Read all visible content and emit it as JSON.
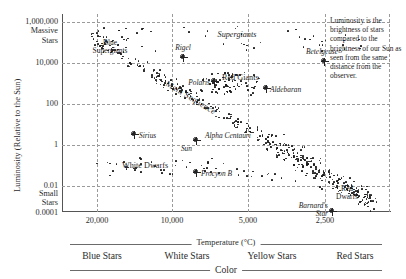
{
  "figure": {
    "caption": "Luminosity is the brightness of stars compared to the brightness of our Sun as seen from the same distance from the observer."
  },
  "chart_data": {
    "type": "scatter",
    "title": "",
    "xlabel": "Temperature (°C)",
    "ylabel": "Luminosity (Relative to the Sun)",
    "secondary_xlabel": "Color",
    "grid": true,
    "legend_position": "none",
    "x_axis": {
      "label": "Temperature (°C)",
      "ticks": [
        "20,000",
        "10,000",
        "5,000",
        "2,500"
      ],
      "tick_values": [
        20000,
        10000,
        5000,
        2500
      ],
      "scale": "log-reversed",
      "range_note": "hot (left) to cool (right)"
    },
    "y_axis": {
      "label": "Luminosity (Relative to the Sun)",
      "ticks": [
        "1,000,000",
        "10,000",
        "100",
        "1",
        "0.01",
        "0.0001"
      ],
      "tick_values": [
        1000000,
        10000,
        100,
        1,
        0.01,
        0.0001
      ],
      "scale": "log",
      "top_annotation": "Massive\nStars",
      "top_annotation_line1": "Massive",
      "top_annotation_line2": "Stars",
      "bottom_annotation_line1": "Small",
      "bottom_annotation_line2": "Stars"
    },
    "color_bands": [
      {
        "label": "Blue Stars"
      },
      {
        "label": "White Stars"
      },
      {
        "label": "Yellow Stars"
      },
      {
        "label": "Red Stars"
      }
    ],
    "region_labels": [
      {
        "name": "blue-supergiants",
        "line1": "Blue",
        "line2": "Supergiants"
      },
      {
        "name": "supergiants",
        "text": "Supergiants"
      },
      {
        "name": "red-giants",
        "text": "Red Giants"
      },
      {
        "name": "main-sequence",
        "text": "Main Sequence"
      },
      {
        "name": "white-dwarfs",
        "text": "White Dwarfs"
      },
      {
        "name": "red-dwarfs",
        "line1": "Red",
        "line2": "Dwarfs"
      }
    ],
    "named_stars": [
      {
        "name": "Rigel",
        "label": "Rigel"
      },
      {
        "name": "Betelgeuse",
        "label": "Betelgeuse"
      },
      {
        "name": "Polaris",
        "label": "Polaris"
      },
      {
        "name": "Aldebaran",
        "label": "Aldebaran"
      },
      {
        "name": "Sirius",
        "label": "Sirius"
      },
      {
        "name": "Alpha Centauri",
        "label": "Alpha Centauri"
      },
      {
        "name": "Sun",
        "label": "Sun"
      },
      {
        "name": "Procyon B",
        "label": "Procyon B"
      },
      {
        "name": "Barnards Star",
        "line1": "Barnard's",
        "line2": "Star"
      }
    ]
  }
}
